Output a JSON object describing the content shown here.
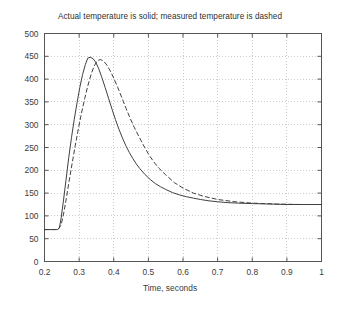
{
  "chart_data": {
    "type": "line",
    "title": "Actual temperature is solid; measured temperature is dashed",
    "xlabel": "Time, seconds",
    "ylabel": "",
    "xlim": [
      0.2,
      1.0
    ],
    "ylim": [
      0,
      500
    ],
    "xticks": [
      "0.2",
      "0.3",
      "0.4",
      "0.5",
      "0.6",
      "0.7",
      "0.8",
      "0.9",
      "1"
    ],
    "xtick_values": [
      0.2,
      0.3,
      0.4,
      0.5,
      0.6,
      0.7,
      0.8,
      0.9,
      1.0
    ],
    "yticks": [
      "0",
      "50",
      "100",
      "150",
      "200",
      "250",
      "300",
      "350",
      "400",
      "450",
      "500"
    ],
    "ytick_values": [
      0,
      50,
      100,
      150,
      200,
      250,
      300,
      350,
      400,
      450,
      500
    ],
    "grid": true,
    "grid_style": "dotted",
    "grid_color": "#cccccc",
    "legend": "none",
    "legend_position": "none",
    "background_color": "#ffffff",
    "axis_color": "#555555",
    "series": [
      {
        "name": "Actual temperature",
        "style": "solid",
        "color": "#404040",
        "x": [
          0.2,
          0.21,
          0.22,
          0.23,
          0.238,
          0.243,
          0.248,
          0.255,
          0.262,
          0.27,
          0.278,
          0.286,
          0.294,
          0.302,
          0.31,
          0.318,
          0.325,
          0.332,
          0.34,
          0.348,
          0.356,
          0.365,
          0.375,
          0.385,
          0.395,
          0.405,
          0.415,
          0.425,
          0.435,
          0.445,
          0.455,
          0.465,
          0.475,
          0.49,
          0.505,
          0.52,
          0.535,
          0.55,
          0.57,
          0.59,
          0.61,
          0.63,
          0.65,
          0.675,
          0.7,
          0.73,
          0.76,
          0.8,
          0.85,
          0.9,
          0.95,
          1.0
        ],
        "y": [
          70,
          70,
          70,
          70,
          70,
          74,
          95,
          135,
          178,
          228,
          272,
          312,
          348,
          382,
          410,
          432,
          446,
          448,
          445,
          437,
          424,
          405,
          382,
          358,
          334,
          311,
          290,
          271,
          254,
          239,
          226,
          214,
          204,
          191,
          180,
          171,
          164,
          158,
          151,
          146,
          142,
          139,
          136,
          133,
          131,
          129,
          128,
          127,
          126,
          125,
          125,
          125
        ]
      },
      {
        "name": "Measured temperature",
        "style": "dashed",
        "color": "#404040",
        "x": [
          0.2,
          0.215,
          0.23,
          0.24,
          0.248,
          0.255,
          0.263,
          0.271,
          0.28,
          0.289,
          0.298,
          0.307,
          0.316,
          0.325,
          0.334,
          0.343,
          0.352,
          0.361,
          0.37,
          0.38,
          0.39,
          0.4,
          0.412,
          0.424,
          0.436,
          0.448,
          0.46,
          0.472,
          0.485,
          0.5,
          0.515,
          0.53,
          0.55,
          0.575,
          0.6,
          0.63,
          0.66,
          0.7,
          0.75,
          0.8,
          0.87,
          0.94,
          1.0
        ],
        "y": [
          70,
          70,
          70,
          71,
          80,
          104,
          138,
          176,
          216,
          255,
          292,
          326,
          357,
          385,
          409,
          428,
          440,
          443,
          440,
          431,
          418,
          402,
          381,
          358,
          335,
          313,
          293,
          275,
          256,
          236,
          219,
          205,
          190,
          173,
          161,
          150,
          143,
          136,
          131,
          128,
          126,
          125,
          125
        ]
      }
    ]
  }
}
